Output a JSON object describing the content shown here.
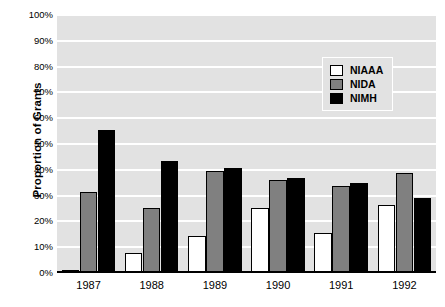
{
  "chart_data": {
    "type": "bar",
    "title": "",
    "subtitle": "",
    "xlabel": "",
    "ylabel": "Proportion of Grants",
    "categories": [
      "1987",
      "1988",
      "1989",
      "1990",
      "1991",
      "1992"
    ],
    "series": [
      {
        "name": "NIAAA",
        "color": "#ffffff",
        "values": [
          0.5,
          7.5,
          14,
          25,
          15,
          26
        ]
      },
      {
        "name": "NIDA",
        "color": "#808080",
        "values": [
          31,
          25,
          39,
          35.5,
          33.5,
          38.5
        ]
      },
      {
        "name": "NIMH",
        "color": "#000000",
        "values": [
          55,
          43,
          40.5,
          36.5,
          34.5,
          28.5
        ]
      }
    ],
    "ylim": [
      0,
      100
    ],
    "ytick_labels": [
      "0%",
      "10%",
      "20%",
      "30%",
      "40%",
      "50%",
      "60%",
      "70%",
      "80%",
      "90%",
      "100%"
    ],
    "ytick_values": [
      0,
      10,
      20,
      30,
      40,
      50,
      60,
      70,
      80,
      90,
      100
    ],
    "grid": true,
    "gridline_color": "#ffffff",
    "plot_background": "#e2e2e2",
    "legend_position": "upper right",
    "legend_entries": [
      "NIAAA",
      "NIDA",
      "NIMH"
    ]
  }
}
